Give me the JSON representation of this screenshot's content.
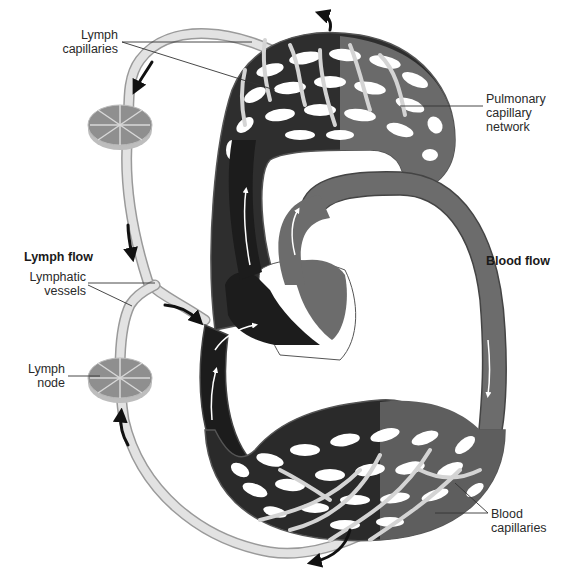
{
  "diagram": {
    "sections": {
      "lymph_flow": "Lymph flow",
      "blood_flow": "Blood flow"
    },
    "labels": {
      "lymph_capillaries_line1": "Lymph",
      "lymph_capillaries_line2": "capillaries",
      "pulmonary_line1": "Pulmonary",
      "pulmonary_line2": "capillary",
      "pulmonary_line3": "network",
      "lymphatic_vessels_line1": "Lymphatic",
      "lymphatic_vessels_line2": "vessels",
      "lymph_node_line1": "Lymph",
      "lymph_node_line2": "node",
      "blood_capillaries_line1": "Blood",
      "blood_capillaries_line2": "capillaries"
    },
    "colors": {
      "deoxygenated_blood": "#1c1c1c",
      "oxygenated_blood": "#6e6e6e",
      "lymph_vessel": "#dcdcdc",
      "lymph_node": "#9a9a9a",
      "flow_arrow": "#111111",
      "leader_line": "#333333"
    }
  }
}
